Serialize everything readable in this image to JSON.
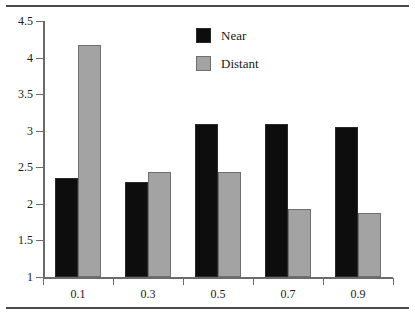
{
  "chart_data": {
    "type": "bar",
    "title": "",
    "subtitle": "",
    "xlabel": "",
    "ylabel": "",
    "categories": [
      "0.1",
      "0.3",
      "0.5",
      "0.7",
      "0.9"
    ],
    "series": [
      {
        "name": "Near",
        "color": "#0d0d0d",
        "values": [
          2.35,
          2.3,
          3.09,
          3.09,
          3.05
        ]
      },
      {
        "name": "Distant",
        "color": "#a3a3a3",
        "values": [
          4.17,
          2.44,
          2.44,
          1.93,
          1.88
        ]
      }
    ],
    "ylim": [
      1,
      4.5
    ],
    "yticks": [
      "1",
      "1.5",
      "2",
      "2.5",
      "3",
      "3.5",
      "4",
      "4.5"
    ],
    "ytick_values": [
      1,
      1.5,
      2,
      2.5,
      3,
      3.5,
      4,
      4.5
    ],
    "xticks": [
      "0.1",
      "0.3",
      "0.5",
      "0.7",
      "0.9"
    ],
    "grid": false,
    "legend_position": "upper-center",
    "legend": [
      "Near",
      "Distant"
    ]
  },
  "figure": {
    "top_rule": "horizontal-rule",
    "bottom_rule": "horizontal-rule"
  }
}
